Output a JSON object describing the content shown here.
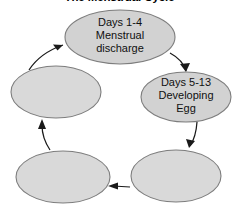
{
  "diagram": {
    "title": "The Menstrual Cycle",
    "type": "cycle-flowchart",
    "direction": "clockwise",
    "node_fill_labeled": "#d2d2d2",
    "node_fill_empty": "#d9d9d9",
    "node_stroke": "#7d7d7d",
    "arrow_color": "#1a1a1a",
    "nodes": [
      {
        "id": "menstrual-discharge",
        "position": "top",
        "cx": 120,
        "cy": 37,
        "rx": 55,
        "ry": 27,
        "lines": [
          "Days 1-4",
          "Menstrual",
          "discharge"
        ],
        "empty": false
      },
      {
        "id": "developing-egg",
        "position": "right",
        "cx": 186,
        "cy": 97,
        "rx": 45,
        "ry": 25,
        "lines": [
          "Days 5-13",
          "Developing",
          "Egg"
        ],
        "empty": false
      },
      {
        "id": "unlabeled-bottom-right",
        "position": "bottom-right",
        "cx": 176,
        "cy": 176,
        "rx": 45,
        "ry": 26,
        "lines": [],
        "empty": true
      },
      {
        "id": "unlabeled-bottom-left",
        "position": "bottom-left",
        "cx": 63,
        "cy": 177,
        "rx": 47,
        "ry": 26,
        "lines": [],
        "empty": true
      },
      {
        "id": "unlabeled-left",
        "position": "left",
        "cx": 56,
        "cy": 92,
        "rx": 45,
        "ry": 26,
        "lines": [],
        "empty": true
      }
    ],
    "arrows": [
      {
        "id": "arrow-top-to-right",
        "from": "menstrual-discharge",
        "to": "developing-egg"
      },
      {
        "id": "arrow-right-to-bottom-right",
        "from": "developing-egg",
        "to": "unlabeled-bottom-right"
      },
      {
        "id": "arrow-bottom-right-to-bottom-left",
        "from": "unlabeled-bottom-right",
        "to": "unlabeled-bottom-left"
      },
      {
        "id": "arrow-bottom-left-to-left",
        "from": "unlabeled-bottom-left",
        "to": "unlabeled-left"
      },
      {
        "id": "arrow-left-to-top",
        "from": "unlabeled-left",
        "to": "menstrual-discharge"
      }
    ]
  }
}
